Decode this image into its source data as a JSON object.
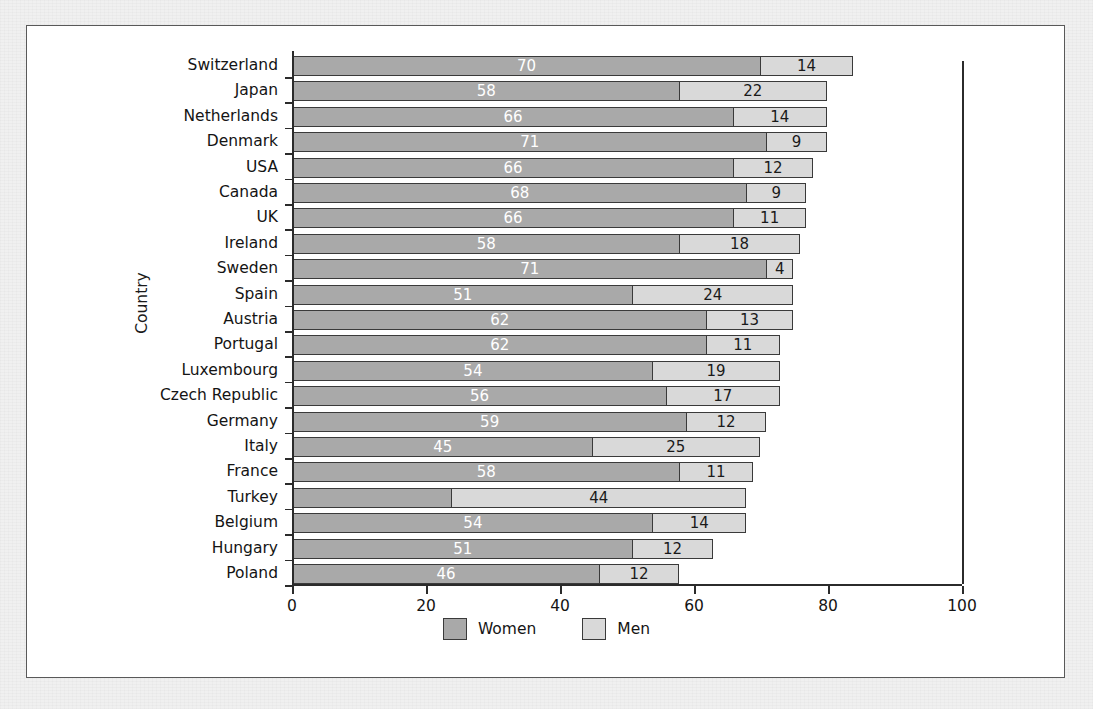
{
  "chart_data": {
    "type": "bar",
    "orientation": "horizontal",
    "stacked": true,
    "title": "",
    "xlabel": "",
    "ylabel": "Country",
    "xlim": [
      0,
      100
    ],
    "xticks": [
      0,
      20,
      40,
      60,
      80,
      100
    ],
    "xtick_labels": [
      "0",
      "20",
      "40",
      "60",
      "80",
      "100"
    ],
    "grid": false,
    "legend_position": "bottom-center",
    "categories": [
      "Switzerland",
      "Japan",
      "Netherlands",
      "Denmark",
      "USA",
      "Canada",
      "UK",
      "Ireland",
      "Sweden",
      "Spain",
      "Austria",
      "Portugal",
      "Luxembourg",
      "Czech Republic",
      "Germany",
      "Italy",
      "France",
      "Turkey",
      "Belgium",
      "Hungary",
      "Poland"
    ],
    "series": [
      {
        "name": "Women",
        "color": "#a9a9a9",
        "values": [
          70,
          58,
          66,
          71,
          66,
          68,
          66,
          58,
          71,
          51,
          62,
          62,
          54,
          56,
          59,
          45,
          58,
          24,
          54,
          51,
          46
        ],
        "labels": [
          "70",
          "58",
          "66",
          "71",
          "66",
          "68",
          "66",
          "58",
          "71",
          "51",
          "62",
          "62",
          "54",
          "56",
          "59",
          "45",
          "58",
          "",
          "54",
          "51",
          "46"
        ]
      },
      {
        "name": "Men",
        "color": "#d9d9d9",
        "values": [
          14,
          22,
          14,
          9,
          12,
          9,
          11,
          18,
          4,
          24,
          13,
          11,
          19,
          17,
          12,
          25,
          11,
          44,
          14,
          12,
          12
        ],
        "labels": [
          "14",
          "22",
          "14",
          "9",
          "12",
          "9",
          "11",
          "18",
          "4",
          "24",
          "13",
          "11",
          "19",
          "17",
          "12",
          "25",
          "11",
          "44",
          "14",
          "12",
          "12"
        ]
      }
    ],
    "totals": [
      84,
      80,
      80,
      80,
      78,
      77,
      77,
      76,
      75,
      75,
      75,
      73,
      73,
      73,
      71,
      70,
      69,
      68,
      68,
      63,
      58
    ]
  },
  "legend": {
    "entries": [
      {
        "label": "Women",
        "color": "#a9a9a9"
      },
      {
        "label": "Men",
        "color": "#d9d9d9"
      }
    ]
  },
  "axes": {
    "y_title": "Country"
  }
}
